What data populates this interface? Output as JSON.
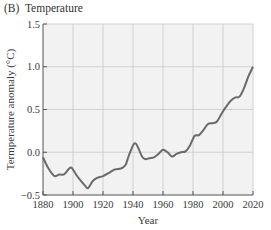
{
  "panel_label": "(B)",
  "title": "Temperature",
  "colors": {
    "plot_background": "#f2f2f2",
    "grid": "#c9c9c9",
    "axis": "#555555",
    "line": "#6a6a6a"
  },
  "chart_data": {
    "type": "line",
    "xlabel": "Year",
    "ylabel": "Termperature anomaly (°C)",
    "xlim": [
      1880,
      2020
    ],
    "ylim": [
      -0.5,
      1.5
    ],
    "x_ticks": [
      1880,
      1900,
      1920,
      1940,
      1960,
      1980,
      2000,
      2020
    ],
    "y_ticks": [
      -0.5,
      0.0,
      0.5,
      1.0,
      1.5
    ],
    "y_tick_labels": [
      "−0.5",
      "0.0",
      "0.5",
      "1.0",
      "1.5"
    ],
    "grid": true,
    "legend": null,
    "series": [
      {
        "name": "Temperature anomaly",
        "x": [
          1880,
          1883,
          1886,
          1888,
          1891,
          1894,
          1897,
          1899,
          1902,
          1905,
          1908,
          1910,
          1913,
          1916,
          1920,
          1924,
          1928,
          1932,
          1935,
          1937,
          1940,
          1942,
          1944,
          1946,
          1948,
          1951,
          1954,
          1957,
          1960,
          1963,
          1966,
          1969,
          1972,
          1975,
          1978,
          1981,
          1984,
          1987,
          1990,
          1993,
          1996,
          1999,
          2002,
          2005,
          2008,
          2011,
          2014,
          2017,
          2020
        ],
        "y": [
          -0.06,
          -0.17,
          -0.25,
          -0.28,
          -0.26,
          -0.26,
          -0.2,
          -0.18,
          -0.26,
          -0.33,
          -0.39,
          -0.42,
          -0.34,
          -0.3,
          -0.28,
          -0.24,
          -0.2,
          -0.19,
          -0.15,
          -0.05,
          0.08,
          0.1,
          0.03,
          -0.05,
          -0.08,
          -0.07,
          -0.06,
          -0.02,
          0.03,
          0.0,
          -0.05,
          -0.02,
          0.0,
          0.01,
          0.08,
          0.19,
          0.2,
          0.26,
          0.33,
          0.34,
          0.36,
          0.45,
          0.53,
          0.6,
          0.64,
          0.65,
          0.75,
          0.89,
          1.0
        ]
      }
    ]
  }
}
